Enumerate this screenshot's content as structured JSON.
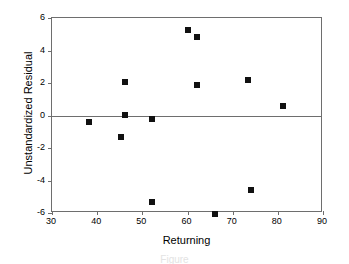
{
  "chart_data": {
    "type": "scatter",
    "title": "",
    "xlabel": "Returning",
    "ylabel": "Unstandardized Residual",
    "xlim": [
      30,
      90
    ],
    "ylim": [
      -6,
      6
    ],
    "xticks": [
      30,
      40,
      50,
      60,
      70,
      80,
      90
    ],
    "yticks": [
      6,
      4,
      2,
      0,
      -2,
      -4,
      -6
    ],
    "grid": false,
    "legend": null,
    "reference_lines": [
      {
        "axis": "y",
        "value": 0
      }
    ],
    "marker": {
      "shape": "square",
      "color": "#111111",
      "size": 6
    },
    "points": [
      {
        "x": 38.3,
        "y": -0.4
      },
      {
        "x": 45.3,
        "y": -1.3
      },
      {
        "x": 46.1,
        "y": 2.05
      },
      {
        "x": 46.2,
        "y": 0.05
      },
      {
        "x": 52.2,
        "y": -0.2
      },
      {
        "x": 52.2,
        "y": -5.3
      },
      {
        "x": 60.0,
        "y": 5.25
      },
      {
        "x": 62.0,
        "y": 4.85
      },
      {
        "x": 62.1,
        "y": 1.85
      },
      {
        "x": 66.0,
        "y": -6.05
      },
      {
        "x": 73.4,
        "y": 2.2
      },
      {
        "x": 74.0,
        "y": -4.6
      },
      {
        "x": 81.1,
        "y": 0.6
      }
    ]
  },
  "caption": {
    "fragment": "Figure"
  },
  "colors": {
    "marker": "#111111",
    "axis": "#6e6e6e",
    "background": "#ffffff",
    "text": "#000000"
  }
}
